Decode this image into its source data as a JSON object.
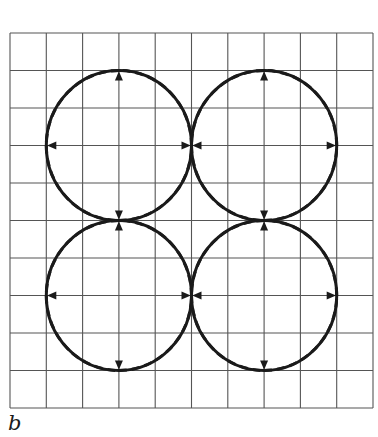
{
  "figure": {
    "label": "b",
    "grid": {
      "columns": 10,
      "rows": 10,
      "line_color": "#555555"
    },
    "circles": [
      {
        "id": "top-left",
        "cx": 3,
        "cy": 3,
        "r": 2
      },
      {
        "id": "top-right",
        "cx": 7,
        "cy": 3,
        "r": 2
      },
      {
        "id": "bottom-left",
        "cx": 3,
        "cy": 7,
        "r": 2
      },
      {
        "id": "bottom-right",
        "cx": 7,
        "cy": 7,
        "r": 2
      }
    ],
    "circle_style": {
      "stroke": "#1a1a1a",
      "style": "solid"
    },
    "inner_curve_style": {
      "stroke": "#1a1a1a",
      "style": "dashed",
      "shape": "astroid of four concave quarter-circle arcs with arrowheads at cardinal points"
    }
  }
}
